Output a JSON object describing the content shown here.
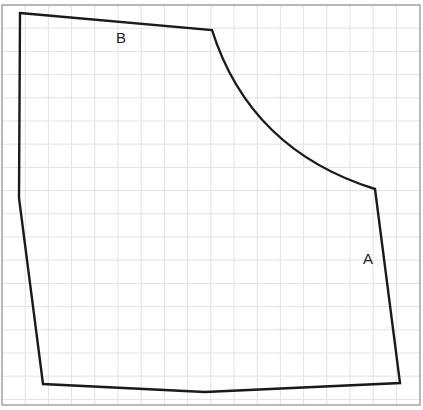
{
  "diagram": {
    "type": "pattern-piece-on-grid",
    "frame": {
      "x": 2,
      "y": 5,
      "width": 418,
      "height": 400,
      "stroke": "#8a8a8a"
    },
    "grid": {
      "spacing": 23.2,
      "color": "#e2e2e2",
      "origin_x": 2,
      "origin_y": 5
    },
    "outline": {
      "stroke": "#1a1a1a",
      "stroke_width": 2.4,
      "vertices": [
        {
          "x": 20,
          "y": 13
        },
        {
          "x": 212,
          "y": 30
        },
        {
          "x": 375,
          "y": 189
        },
        {
          "x": 400,
          "y": 383
        },
        {
          "x": 205,
          "y": 392
        },
        {
          "x": 43,
          "y": 384
        },
        {
          "x": 19,
          "y": 198
        }
      ],
      "curve_segment": {
        "from": 1,
        "to": 2,
        "control": {
          "x": 250,
          "y": 150
        }
      }
    },
    "labels": [
      {
        "id": "label-b",
        "text": "B",
        "x": 121,
        "y": 43
      },
      {
        "id": "label-a",
        "text": "A",
        "x": 368,
        "y": 264
      }
    ]
  }
}
